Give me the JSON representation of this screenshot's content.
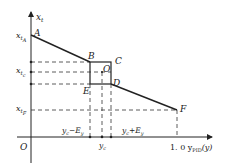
{
  "diagram": {
    "axis_y_label": "x",
    "axis_y_sub": "t",
    "axis_x_label": "1. 0 y",
    "axis_x_sub": "PID",
    "axis_x_suffix": "(y)",
    "origin": "O",
    "points": {
      "A": "A",
      "B": "B",
      "C": "C",
      "D": "D",
      "E": "E",
      "F": "F",
      "O": "O"
    },
    "y_ticks": [
      {
        "main": "x",
        "sub": "t",
        "subsub": "A"
      },
      {
        "main": "x",
        "sub": "t",
        "subsub": "c"
      },
      {
        "main": "x",
        "sub": "t",
        "subsub": "F"
      }
    ],
    "x_ticks": [
      {
        "label": "y",
        "sub": "c",
        "suffix": "−E",
        "suffix_sub": "y"
      },
      {
        "label": "y",
        "sub": "c"
      },
      {
        "label": "y",
        "sub": "c",
        "suffix": "+E",
        "suffix_sub": "y"
      }
    ],
    "line_color": "#222222"
  }
}
